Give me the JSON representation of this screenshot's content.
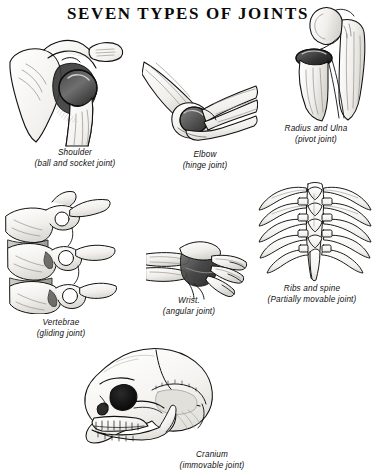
{
  "page": {
    "title": "SEVEN TYPES OF JOINTS",
    "background_color": "#ffffff",
    "ink_color": "#111111"
  },
  "figures": [
    {
      "id": "shoulder",
      "icon": "shoulder-joint-illustration",
      "name": "Shoulder",
      "joint_type": "(ball and socket joint)"
    },
    {
      "id": "elbow",
      "icon": "elbow-joint-illustration",
      "name": "Elbow",
      "joint_type": "(hinge joint)"
    },
    {
      "id": "radius",
      "icon": "radius-ulna-joint-illustration",
      "name": "Radius and Ulna",
      "joint_type": "(pivot joint)"
    },
    {
      "id": "vertebrae",
      "icon": "vertebrae-joint-illustration",
      "name": "Vertebrae",
      "joint_type": "(gliding joint)"
    },
    {
      "id": "wrist",
      "icon": "wrist-joint-illustration",
      "name": "Wrist.",
      "joint_type": "(angular joint)"
    },
    {
      "id": "ribs",
      "icon": "ribs-spine-joint-illustration",
      "name": "Ribs and spine",
      "joint_type": "(Partially movable joint)"
    },
    {
      "id": "cranium",
      "icon": "cranium-joint-illustration",
      "name": "Cranium",
      "joint_type": "(immovable joint)"
    }
  ]
}
